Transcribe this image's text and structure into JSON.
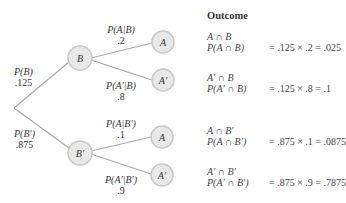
{
  "header": {
    "outcome_label": "Outcome"
  },
  "root": {
    "branches": [
      {
        "label": "P(B)",
        "value": ".125"
      },
      {
        "label": "P(B′)",
        "value": ".875"
      }
    ]
  },
  "nodes": {
    "B": "B",
    "Bp": "B′",
    "A_top": "A",
    "Ap_top": "A′",
    "A_bot": "A",
    "Ap_bot": "A′"
  },
  "second_level": [
    {
      "label": "P(A|B)",
      "value": ".2"
    },
    {
      "label": "P(A′|B)",
      "value": ".8"
    },
    {
      "label": "P(A|B′)",
      "value": ".1"
    },
    {
      "label": "P(A′|B′)",
      "value": ".9"
    }
  ],
  "outcomes": [
    {
      "event": "A ∩ B",
      "prob_label": "P(A ∩ B)",
      "calc": "= .125 × .2 = .025"
    },
    {
      "event": "A′ ∩ B",
      "prob_label": "P(A′ ∩ B)",
      "calc": "= .125 × .8 = .1"
    },
    {
      "event": "A ∩ B′",
      "prob_label": "P(A ∩ B′)",
      "calc": "= .875 × .1 = .0875"
    },
    {
      "event": "A′ ∩ B′",
      "prob_label": "P(A′ ∩ B′)",
      "calc": "= .875 × .9 = .7875"
    }
  ],
  "colors": {
    "line": "#a8a8a8",
    "node_fill": "#e6e6e6",
    "node_stroke": "#c4c4c4"
  }
}
